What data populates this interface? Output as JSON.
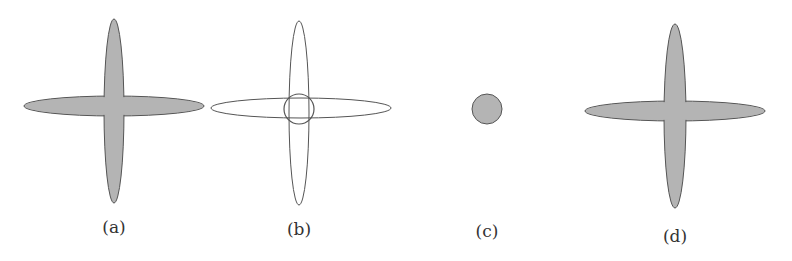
{
  "figure": {
    "colors": {
      "fill": "#b4b4b4",
      "stroke": "#555555",
      "background": "#ffffff"
    },
    "panels": [
      {
        "label": "(a)",
        "shape": "filled-cross",
        "description": "two filled gray orthogonal ellipses forming a cross"
      },
      {
        "label": "(b)",
        "shape": "outlined-cross-with-circle",
        "description": "two outlined orthogonal ellipses with a small circle at their intersection"
      },
      {
        "label": "(c)",
        "shape": "filled-circle",
        "description": "small filled gray circle"
      },
      {
        "label": "(d)",
        "shape": "filled-cross",
        "description": "two filled gray orthogonal ellipses forming a cross"
      }
    ]
  }
}
